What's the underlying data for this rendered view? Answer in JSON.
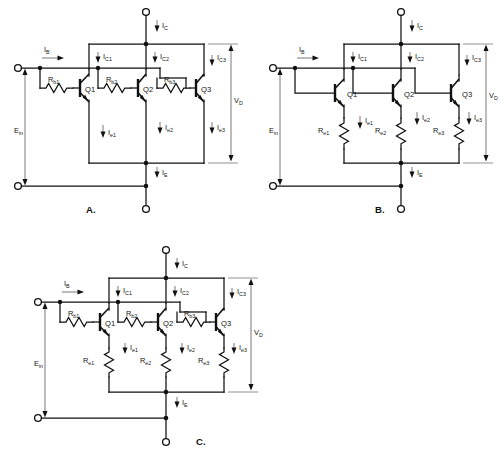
{
  "figure": {
    "background": "#ffffff",
    "ink": "#111111",
    "dim_color": "#555555"
  },
  "labels": {
    "i_b": "I",
    "i_b_sub": "B",
    "i_c": "I",
    "i_c_sub": "C",
    "i_e": "I",
    "i_e_sub": "E",
    "i_c1": "I",
    "i_c1_sub": "C1",
    "i_c2": "I",
    "i_c2_sub": "C2",
    "i_c3": "I",
    "i_c3_sub": "C3",
    "i_e1": "I",
    "i_e1_sub": "e1",
    "i_e2": "I",
    "i_e2_sub": "e2",
    "i_e3": "I",
    "i_e3_sub": "e3",
    "e_in": "E",
    "e_in_sub": "in",
    "v_d": "V",
    "v_d_sub": "D",
    "q1": "Q1",
    "q2": "Q2",
    "q3": "Q3",
    "rb1": "R",
    "rb1_sub": "b1",
    "rb2": "R",
    "rb2_sub": "b2",
    "rb3": "R",
    "rb3_sub": "b3",
    "re1": "R",
    "re1_sub": "e1",
    "re2": "R",
    "re2_sub": "e2",
    "re3": "R",
    "re3_sub": "e3"
  },
  "circuits": [
    {
      "id": "A",
      "caption": "A.",
      "origin": {
        "x": 0,
        "y": 0
      },
      "description": "Three parallel NPN transistors with individual base resistors Rb1, Rb2, Rb3 and common emitters.",
      "has_base_resistors": true,
      "has_emitter_resistors": false,
      "transistors": [
        "Q1",
        "Q2",
        "Q3"
      ],
      "resistors": [
        "Rb1",
        "Rb2",
        "Rb3"
      ],
      "currents": [
        "IB",
        "IC",
        "IE",
        "IC1",
        "IC2",
        "IC3",
        "Ie1",
        "Ie2",
        "Ie3"
      ],
      "voltages": [
        "Ein",
        "VD"
      ]
    },
    {
      "id": "B",
      "caption": "B.",
      "origin": {
        "x": 255,
        "y": 0
      },
      "description": "Three parallel NPN transistors with common bases and individual emitter resistors Re1, Re2, Re3.",
      "has_base_resistors": false,
      "has_emitter_resistors": true,
      "transistors": [
        "Q1",
        "Q2",
        "Q3"
      ],
      "resistors": [
        "Re1",
        "Re2",
        "Re3"
      ],
      "currents": [
        "IB",
        "IC",
        "IE",
        "IC1",
        "IC2",
        "IC3",
        "Ie1",
        "Ie2",
        "Ie3"
      ],
      "voltages": [
        "Ein",
        "VD"
      ]
    },
    {
      "id": "C",
      "caption": "C.",
      "origin": {
        "x": 20,
        "y": 240
      },
      "description": "Three parallel NPN transistors with both base resistors Rb1-Rb3 and emitter resistors Re1-Re3.",
      "has_base_resistors": true,
      "has_emitter_resistors": true,
      "transistors": [
        "Q1",
        "Q2",
        "Q3"
      ],
      "resistors": [
        "Rb1",
        "Rb2",
        "Rb3",
        "Re1",
        "Re2",
        "Re3"
      ],
      "currents": [
        "IB",
        "IC",
        "IE",
        "IC1",
        "IC2",
        "IC3",
        "Ie1",
        "Ie2",
        "Ie3"
      ],
      "voltages": [
        "Ein",
        "VD"
      ]
    }
  ]
}
